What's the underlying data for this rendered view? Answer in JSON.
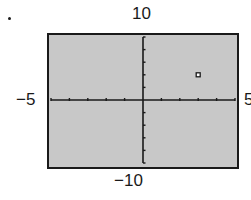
{
  "chart_data": {
    "type": "scatter",
    "title": "",
    "xlabel": "",
    "ylabel": "",
    "xlim": [
      -5,
      5
    ],
    "ylim": [
      -10,
      10
    ],
    "xscale_tick": 1,
    "yscale_tick": 2,
    "grid": false,
    "window_labels": {
      "xmin": "−5",
      "xmax": "5",
      "ymin": "−10",
      "ymax": "10"
    },
    "points": [
      {
        "x": 3,
        "y": 4,
        "marker": "square"
      }
    ],
    "background_color": "#c8c8c8",
    "frame_color": "#1a1a1a"
  }
}
